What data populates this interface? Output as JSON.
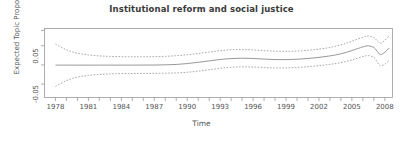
{
  "chart_data": {
    "type": "line",
    "title": "Institutional reform and social justice",
    "xlabel": "Time",
    "ylabel": "Expected Topic Proportion",
    "xlim": [
      1977.0,
      2008.7
    ],
    "ylim": [
      -0.085,
      0.095
    ],
    "grid": false,
    "legend": null,
    "xticks_major": [
      1978,
      1981,
      1984,
      1987,
      1990,
      1993,
      1996,
      1999,
      2002,
      2005,
      2008
    ],
    "xtick_labels": [
      "1978",
      "1981",
      "1984",
      "1987",
      "1990",
      "1993",
      "1996",
      "1999",
      "2002",
      "2005",
      "2008"
    ],
    "xticks_minor": [
      1978,
      1979,
      1980,
      1981,
      1982,
      1983,
      1984,
      1985,
      1986,
      1987,
      1988,
      1989,
      1990,
      1991,
      1992,
      1993,
      1994,
      1995,
      1996,
      1997,
      1998,
      1999,
      2000,
      2001,
      2002,
      2003,
      2004,
      2005,
      2006,
      2007,
      2008
    ],
    "yticks": [
      -0.05,
      0.05
    ],
    "ytick_labels": [
      "-0.05",
      "0.05"
    ],
    "yticks_all": [
      -0.05,
      0.0,
      0.05,
      0.09
    ],
    "x": [
      1978,
      1979,
      1980,
      1981,
      1982,
      1983,
      1984,
      1985,
      1986,
      1987,
      1988,
      1989,
      1990,
      1991,
      1992,
      1993,
      1994,
      1995,
      1996,
      1997,
      1998,
      1999,
      2000,
      2001,
      2002,
      2003,
      2004,
      2005,
      2006,
      2006.5,
      2007,
      2007.3,
      2007.6,
      2008,
      2008.4
    ],
    "series": [
      {
        "name": "estimate",
        "style": "solid",
        "color": "#8c8c8c",
        "values": [
          -0.0005,
          -0.0005,
          -0.0005,
          -0.0005,
          -0.0005,
          -0.0005,
          -0.0005,
          -0.0005,
          -0.0004,
          -0.0003,
          0.0002,
          0.0012,
          0.0035,
          0.0068,
          0.0105,
          0.0142,
          0.0166,
          0.0175,
          0.0168,
          0.0152,
          0.014,
          0.0138,
          0.0148,
          0.0168,
          0.0196,
          0.0235,
          0.029,
          0.0375,
          0.047,
          0.0498,
          0.0455,
          0.0358,
          0.0268,
          0.033,
          0.044
        ]
      },
      {
        "name": "upper-95ci",
        "style": "dashed",
        "color": "#9a9a9a",
        "values": [
          0.0545,
          0.0395,
          0.0305,
          0.0262,
          0.0235,
          0.0222,
          0.0215,
          0.0212,
          0.0212,
          0.0216,
          0.0224,
          0.024,
          0.0264,
          0.0298,
          0.0336,
          0.0372,
          0.0394,
          0.04,
          0.039,
          0.0372,
          0.0358,
          0.0354,
          0.0362,
          0.0382,
          0.0412,
          0.0455,
          0.052,
          0.0618,
          0.0722,
          0.0752,
          0.0715,
          0.0632,
          0.056,
          0.064,
          0.076
        ]
      },
      {
        "name": "lower-95ci",
        "style": "dashed",
        "color": "#9a9a9a",
        "values": [
          -0.056,
          -0.041,
          -0.0318,
          -0.0275,
          -0.0248,
          -0.0234,
          -0.0226,
          -0.0224,
          -0.0222,
          -0.022,
          -0.0215,
          -0.0208,
          -0.0192,
          -0.0162,
          -0.0126,
          -0.0088,
          -0.0062,
          -0.005,
          -0.0054,
          -0.0068,
          -0.0078,
          -0.0078,
          -0.0066,
          -0.0046,
          -0.002,
          0.0015,
          0.006,
          0.0132,
          0.0218,
          0.0244,
          0.0195,
          0.0084,
          -0.0024,
          0.002,
          0.012
        ]
      }
    ],
    "axis_color": "#9a9a9a",
    "box": true
  }
}
